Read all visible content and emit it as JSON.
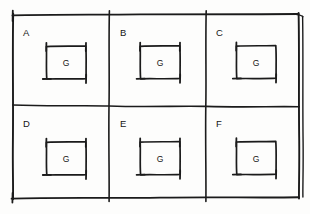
{
  "diagram": {
    "style": "hand-drawn pencil sketch on white paper",
    "ink_color": "#1b1b1b",
    "paper_color": "#fdfdfc",
    "grid": {
      "rows": 2,
      "columns": 3,
      "outer_frame": {
        "x": 12,
        "y": 14,
        "width": 287,
        "height": 185,
        "right_edge_doubled": true
      },
      "vertical_dividers_x": [
        109,
        206
      ],
      "horizontal_dividers_y": [
        106
      ]
    },
    "cells": [
      {
        "label": "A",
        "row": 0,
        "column": 0,
        "label_x": 23,
        "label_y": 36,
        "inner_box": {
          "x": 46,
          "y": 46,
          "width": 40,
          "height": 33,
          "label": "G"
        }
      },
      {
        "label": "B",
        "row": 0,
        "column": 1,
        "label_x": 120,
        "label_y": 36,
        "inner_box": {
          "x": 140,
          "y": 46,
          "width": 40,
          "height": 33,
          "label": "G"
        }
      },
      {
        "label": "C",
        "row": 0,
        "column": 2,
        "label_x": 216,
        "label_y": 36,
        "inner_box": {
          "x": 236,
          "y": 46,
          "width": 40,
          "height": 33,
          "label": "G"
        }
      },
      {
        "label": "D",
        "row": 1,
        "column": 0,
        "label_x": 23,
        "label_y": 127,
        "inner_box": {
          "x": 46,
          "y": 142,
          "width": 40,
          "height": 33,
          "label": "G"
        }
      },
      {
        "label": "E",
        "row": 1,
        "column": 1,
        "label_x": 120,
        "label_y": 127,
        "inner_box": {
          "x": 140,
          "y": 142,
          "width": 40,
          "height": 33,
          "label": "G"
        }
      },
      {
        "label": "F",
        "row": 1,
        "column": 2,
        "label_x": 216,
        "label_y": 127,
        "inner_box": {
          "x": 236,
          "y": 142,
          "width": 40,
          "height": 33,
          "label": "G"
        }
      }
    ]
  }
}
